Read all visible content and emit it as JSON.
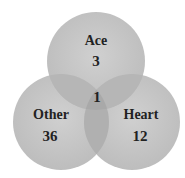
{
  "diagram": {
    "type": "venn",
    "colors": {
      "circle_fill": "#c8c8c8",
      "overlap_fill": "#b2b2b2",
      "text": "#222222",
      "background": "#ffffff"
    },
    "sets": [
      {
        "name": "Ace",
        "only_count": "3"
      },
      {
        "name": "Other",
        "only_count": "36"
      },
      {
        "name": "Heart",
        "only_count": "12"
      }
    ],
    "intersections": [
      {
        "sets": [
          "Ace",
          "Heart"
        ],
        "count": "1"
      }
    ]
  }
}
